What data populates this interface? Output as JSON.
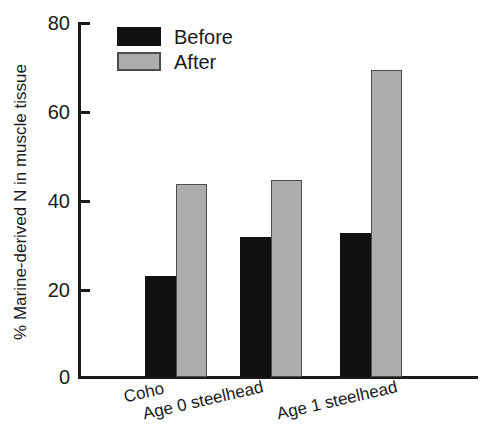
{
  "chart_data": {
    "type": "bar",
    "title": "",
    "xlabel": "",
    "ylabel": "% Marine-derived N in muscle tissue",
    "categories": [
      "Coho",
      "Age 0 steelhead",
      "Age 1 steelhead"
    ],
    "series": [
      {
        "name": "Before",
        "color": "#111111",
        "values": [
          22.8,
          31.6,
          32.5
        ]
      },
      {
        "name": "After",
        "color": "#adadad",
        "values": [
          43.7,
          44.6,
          69.4
        ]
      }
    ],
    "ylim": [
      0,
      80
    ],
    "yticks": [
      0,
      20,
      40,
      60,
      80
    ],
    "ytick_labels": [
      "0",
      "20",
      "40",
      "60",
      "80"
    ],
    "grid": false,
    "legend_position": "top-left",
    "xtick_label_rotation": -13
  },
  "legend": {
    "items": [
      {
        "label": "Before",
        "swatch": "black-swatch"
      },
      {
        "label": "After",
        "swatch": "gray-swatch"
      }
    ]
  },
  "axes": {
    "y_title": "% Marine-derived N in muscle tissue",
    "y_tick_labels": [
      "80",
      "60",
      "40",
      "20",
      "0"
    ],
    "x_tick_labels": [
      "Coho",
      "Age 0 steelhead",
      "Age 1 steelhead"
    ]
  },
  "colors": {
    "before": "#111111",
    "after": "#adadad",
    "axis": "#1a1a1a",
    "background": "#ffffff"
  }
}
